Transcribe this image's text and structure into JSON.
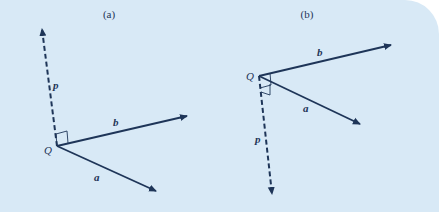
{
  "diagram": {
    "background": "#d8e9f6",
    "stroke_color": "#1e3558",
    "panels": [
      {
        "caption": "(a)",
        "origin_label": "Q",
        "vectors": [
          {
            "name": "p",
            "label": "p",
            "style": "dashed",
            "direction": "up"
          },
          {
            "name": "b",
            "label": "b",
            "style": "solid",
            "direction": "upper-right"
          },
          {
            "name": "a",
            "label": "a",
            "style": "solid",
            "direction": "lower-right"
          }
        ],
        "right_angle_marker": "between p and plane of a, b"
      },
      {
        "caption": "(b)",
        "origin_label": "Q",
        "vectors": [
          {
            "name": "b",
            "label": "b",
            "style": "solid",
            "direction": "upper-right"
          },
          {
            "name": "a",
            "label": "a",
            "style": "solid",
            "direction": "lower-right"
          },
          {
            "name": "p",
            "label": "p",
            "style": "dashed",
            "direction": "down"
          }
        ],
        "right_angle_marker": "between p and plane of a, b"
      }
    ]
  }
}
